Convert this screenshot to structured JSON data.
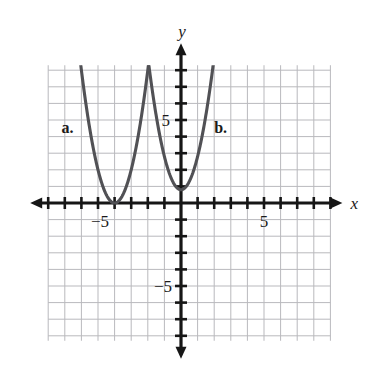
{
  "figure": {
    "type": "math-graph",
    "background_color": "#ffffff",
    "grid_color": "#b9b9bd",
    "axis_color": "#161616",
    "curve_color": "#515155"
  },
  "axes": {
    "x_label": "x",
    "y_label": "y",
    "x_tick_labels": [
      {
        "text": "−5",
        "value": -5
      },
      {
        "text": "5",
        "value": 5
      }
    ],
    "y_tick_labels": [
      {
        "text": "5",
        "value": 5
      },
      {
        "text": "−5",
        "value": -5
      }
    ]
  },
  "annotations": [
    {
      "text": "a.",
      "x": -7.2,
      "y": 4.2
    },
    {
      "text": "b.",
      "x": 2.0,
      "y": 4.2
    }
  ],
  "chart_data": {
    "type": "line",
    "title": "",
    "xlabel": "x",
    "ylabel": "y",
    "xlim": [
      -8,
      9
    ],
    "ylim": [
      -8.3,
      8.3
    ],
    "grid": true,
    "grid_step": 1,
    "tick_step": 1,
    "legend": "inline-labels",
    "series": [
      {
        "name": "a.",
        "label": "a.",
        "type": "parabola",
        "vertex": [
          -4,
          0
        ],
        "leading_coefficient": 2,
        "equation": "y = 2(x + 4)^2",
        "x": [
          -6.05,
          -5.6,
          -5.2,
          -4.8,
          -4.4,
          -4,
          -3.6,
          -3.2,
          -2.8,
          -2.4,
          -2.0,
          -1.85
        ],
        "y": [
          8.4,
          5.12,
          2.88,
          1.28,
          0.32,
          0,
          0.32,
          1.28,
          2.88,
          5.12,
          8.0,
          9.245
        ]
      },
      {
        "name": "b.",
        "label": "b.",
        "type": "parabola",
        "vertex": [
          0,
          0.8
        ],
        "leading_coefficient": 2,
        "equation": "y = 2x^2 + 0.8",
        "x": [
          -2.05,
          -1.6,
          -1.2,
          -0.8,
          -0.4,
          0,
          0.4,
          0.8,
          1.2,
          1.6,
          2.0,
          2.05
        ],
        "y": [
          9.2,
          5.92,
          3.68,
          2.08,
          1.12,
          0.8,
          1.12,
          2.08,
          3.68,
          5.92,
          8.8,
          9.2
        ]
      }
    ]
  }
}
